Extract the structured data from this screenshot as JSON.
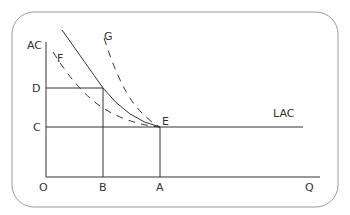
{
  "diagram": {
    "type": "economics-cost-curves",
    "axes": {
      "y_label": "AC",
      "x_label": "Q",
      "origin_label": "O"
    },
    "y_ticks": [
      {
        "label": "D"
      },
      {
        "label": "C"
      }
    ],
    "x_ticks": [
      {
        "label": "B"
      },
      {
        "label": "A"
      }
    ],
    "curves": [
      {
        "name": "solid-cost-curve",
        "style": "solid",
        "label": ""
      },
      {
        "name": "F",
        "style": "dashed",
        "label": "F"
      },
      {
        "name": "G",
        "style": "dashed",
        "label": "G"
      },
      {
        "name": "LAC",
        "style": "solid",
        "label": "LAC"
      }
    ],
    "points": [
      {
        "label": "E",
        "description": "tangency point where curves meet LAC"
      }
    ],
    "colors": {
      "line": "#333333",
      "frame": "#999999"
    }
  }
}
